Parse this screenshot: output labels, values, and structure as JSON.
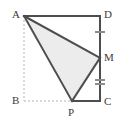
{
  "figure": {
    "canvas": {
      "width": 120,
      "height": 122
    },
    "colors": {
      "solid_stroke": "#4d4d4d",
      "dashed_stroke": "#b3b3b3",
      "shaded_fill": "#ececec",
      "tick_stroke": "#8c8c8c",
      "label_text": "#3a3a3a",
      "background": "#ffffff"
    },
    "vertices": [
      {
        "name": "A",
        "label": "A",
        "x": 24,
        "y": 16,
        "label_x": 12,
        "label_y": 9
      },
      {
        "name": "D",
        "label": "D",
        "x": 100,
        "y": 16,
        "label_x": 104,
        "label_y": 9
      },
      {
        "name": "M",
        "label": "M",
        "x": 100,
        "y": 58,
        "label_x": 104,
        "label_y": 52
      },
      {
        "name": "C",
        "label": "C",
        "x": 100,
        "y": 101,
        "label_x": 104,
        "label_y": 96
      },
      {
        "name": "P",
        "label": "P",
        "x": 72,
        "y": 101,
        "label_x": 68,
        "label_y": 107
      },
      {
        "name": "B",
        "label": "B",
        "x": 24,
        "y": 101,
        "label_x": 12,
        "label_y": 95
      }
    ],
    "shaded_polygon": {
      "name": "triangle-AMP",
      "points": "24,16 100,58 72,101",
      "fill": "#ececec"
    },
    "solid_segments": [
      {
        "name": "segment-AD",
        "from": "A",
        "to": "D",
        "x1": 24,
        "y1": 16,
        "x2": 100,
        "y2": 16
      },
      {
        "name": "segment-DM",
        "from": "D",
        "to": "M",
        "x1": 100,
        "y1": 16,
        "x2": 100,
        "y2": 58
      },
      {
        "name": "segment-MC",
        "from": "M",
        "to": "C",
        "x1": 100,
        "y1": 58,
        "x2": 100,
        "y2": 101
      },
      {
        "name": "segment-PC",
        "from": "P",
        "to": "C",
        "x1": 72,
        "y1": 101,
        "x2": 100,
        "y2": 101
      },
      {
        "name": "segment-AM",
        "from": "A",
        "to": "M",
        "x1": 24,
        "y1": 16,
        "x2": 100,
        "y2": 58
      },
      {
        "name": "segment-AP",
        "from": "A",
        "to": "P",
        "x1": 24,
        "y1": 16,
        "x2": 72,
        "y2": 101
      },
      {
        "name": "segment-MP",
        "from": "M",
        "to": "P",
        "x1": 100,
        "y1": 58,
        "x2": 72,
        "y2": 101
      }
    ],
    "dashed_segments": [
      {
        "name": "segment-AB",
        "from": "A",
        "to": "B",
        "x1": 24,
        "y1": 16,
        "x2": 24,
        "y2": 101
      },
      {
        "name": "segment-BP",
        "from": "B",
        "to": "P",
        "x1": 24,
        "y1": 101,
        "x2": 72,
        "y2": 101
      }
    ],
    "tick_marks": [
      {
        "name": "tick-mark-DM-single",
        "on_segment": "DM",
        "count": 1,
        "strokes": [
          {
            "x1": 95,
            "y1": 32,
            "x2": 105,
            "y2": 32
          }
        ]
      },
      {
        "name": "tick-mark-MC-double",
        "on_segment": "MC",
        "count": 2,
        "strokes": [
          {
            "x1": 95,
            "y1": 80,
            "x2": 105,
            "y2": 80
          },
          {
            "x1": 95,
            "y1": 84,
            "x2": 105,
            "y2": 84
          }
        ]
      }
    ]
  }
}
